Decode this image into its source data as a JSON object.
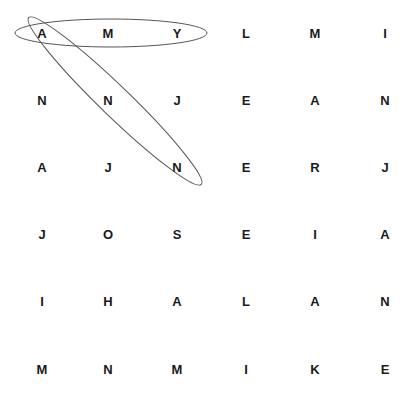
{
  "puzzle": {
    "type": "word-search",
    "rows": [
      [
        "A",
        "M",
        "Y",
        "L",
        "M",
        "I"
      ],
      [
        "N",
        "N",
        "J",
        "E",
        "A",
        "N"
      ],
      [
        "A",
        "J",
        "N",
        "E",
        "R",
        "J"
      ],
      [
        "J",
        "O",
        "S",
        "E",
        "I",
        "A"
      ],
      [
        "I",
        "H",
        "A",
        "L",
        "A",
        "N"
      ],
      [
        "M",
        "N",
        "M",
        "I",
        "K",
        "E"
      ]
    ],
    "found_words": [
      {
        "word": "AMY",
        "direction": "horizontal",
        "start": [
          0,
          0
        ],
        "end": [
          0,
          2
        ]
      },
      {
        "word": "ANN",
        "direction": "diagonal",
        "start": [
          0,
          0
        ],
        "end": [
          2,
          2
        ]
      }
    ],
    "line_color": "#555555"
  }
}
